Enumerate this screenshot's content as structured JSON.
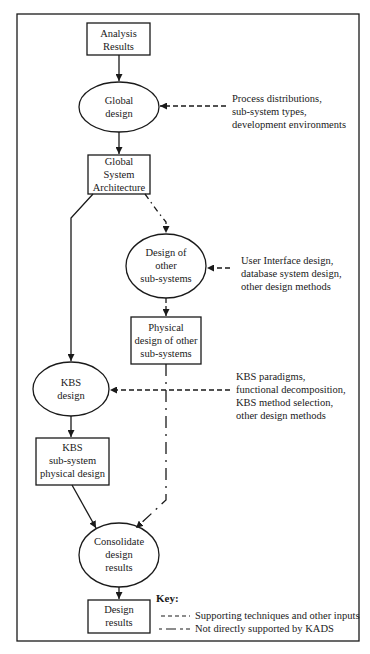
{
  "diagram": {
    "nodes": [
      {
        "id": "analysis-results",
        "shape": "rectangle",
        "lines": [
          "Analysis",
          "Results"
        ]
      },
      {
        "id": "global-design",
        "shape": "ellipse",
        "lines": [
          "Global",
          "design"
        ]
      },
      {
        "id": "global-system-architecture",
        "shape": "rectangle",
        "lines": [
          "Global",
          "System",
          "Architecture"
        ]
      },
      {
        "id": "design-other-subsystems",
        "shape": "ellipse",
        "lines": [
          "Design of",
          "other",
          "sub-systems"
        ]
      },
      {
        "id": "physical-design-other-subsystems",
        "shape": "rectangle",
        "lines": [
          "Physical",
          "design of other",
          "sub-systems"
        ]
      },
      {
        "id": "kbs-design",
        "shape": "ellipse",
        "lines": [
          "KBS",
          "design"
        ]
      },
      {
        "id": "kbs-subsystem-physical-design",
        "shape": "rectangle",
        "lines": [
          "KBS",
          "sub-system",
          "physical design"
        ]
      },
      {
        "id": "consolidate-design-results",
        "shape": "ellipse",
        "lines": [
          "Consolidate",
          "design",
          "results"
        ]
      },
      {
        "id": "design-results",
        "shape": "rectangle",
        "lines": [
          "Design",
          "results"
        ]
      }
    ],
    "inputs": [
      {
        "target": "global-design",
        "lines": [
          "Process distributions,",
          "sub-system types,",
          "development environments"
        ]
      },
      {
        "target": "design-other-subsystems",
        "lines": [
          "User Interface design,",
          "database system design,",
          "other design methods"
        ]
      },
      {
        "target": "kbs-design",
        "lines": [
          "KBS paradigms,",
          "functional decomposition,",
          "KBS method selection,",
          "other design methods"
        ]
      }
    ],
    "edges": [
      {
        "from": "analysis-results",
        "to": "global-design",
        "style": "solid"
      },
      {
        "from": "global-design",
        "to": "global-system-architecture",
        "style": "solid"
      },
      {
        "from": "global-system-architecture",
        "to": "kbs-design",
        "style": "solid"
      },
      {
        "from": "global-system-architecture",
        "to": "design-other-subsystems",
        "style": "dash-dot"
      },
      {
        "from": "design-other-subsystems",
        "to": "physical-design-other-subsystems",
        "style": "dash-dot"
      },
      {
        "from": "kbs-design",
        "to": "kbs-subsystem-physical-design",
        "style": "solid"
      },
      {
        "from": "kbs-subsystem-physical-design",
        "to": "consolidate-design-results",
        "style": "solid"
      },
      {
        "from": "physical-design-other-subsystems",
        "to": "consolidate-design-results",
        "style": "dash-dot"
      },
      {
        "from": "consolidate-design-results",
        "to": "design-results",
        "style": "solid"
      }
    ],
    "key": {
      "title": "Key:",
      "items": [
        {
          "style": "short-dash",
          "label": "Supporting techniques and other inputs"
        },
        {
          "style": "long-dash",
          "label": "Not directly supported by KADS"
        }
      ]
    },
    "colors": {
      "stroke": "#1a1a1a",
      "background": "#ffffff"
    }
  }
}
